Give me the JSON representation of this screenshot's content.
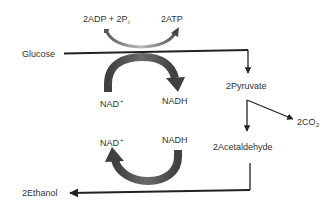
{
  "diagram": {
    "colors": {
      "line": "#222222",
      "thick_arrow": "#4a4a4a",
      "text": "#333333",
      "background": "#ffffff"
    },
    "nodes": {
      "glucose": "Glucose",
      "pyruvate": "2Pyruvate",
      "acetaldehyde": "2Acetaldehyde",
      "ethanol": "2Ethanol",
      "co2": {
        "text": "2CO",
        "sub": "2"
      }
    },
    "cofactors": {
      "adp": {
        "text": "2ADP + 2P",
        "sub": "i"
      },
      "atp": "2ATP",
      "nad_top": {
        "text": "NAD",
        "sup": "+"
      },
      "nadh_top": "NADH",
      "nad_bottom": {
        "text": "NAD",
        "sup": "+"
      },
      "nadh_bottom": "NADH"
    },
    "edges": [
      {
        "from": "Glucose",
        "to": "2Pyruvate",
        "coupled": [
          "2ADP + 2Pi → 2ATP",
          "NAD+ → NADH"
        ]
      },
      {
        "from": "2Pyruvate",
        "to": "2CO2"
      },
      {
        "from": "2Pyruvate",
        "to": "2Acetaldehyde"
      },
      {
        "from": "2Acetaldehyde",
        "to": "2Ethanol",
        "coupled": [
          "NADH → NAD+"
        ]
      }
    ]
  }
}
